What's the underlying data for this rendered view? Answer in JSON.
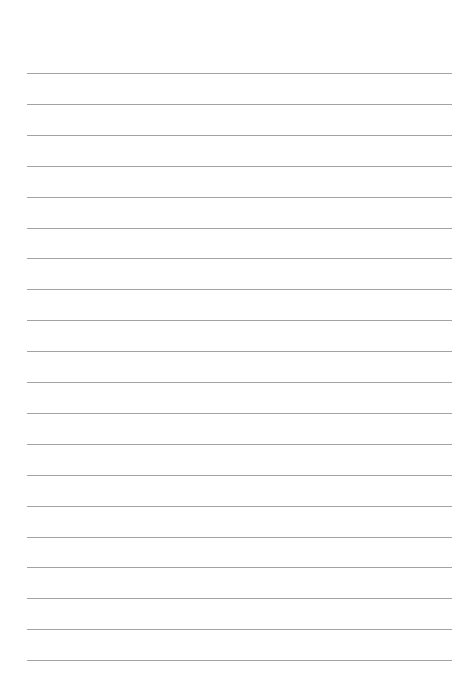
{
  "page": {
    "type": "lined-paper",
    "background_color": "#ffffff",
    "rule_color": "#a3a3a3",
    "rule_count": 20,
    "first_rule_y": 73,
    "rule_spacing": 30.9,
    "rule_left": 27,
    "rule_right": 452
  }
}
